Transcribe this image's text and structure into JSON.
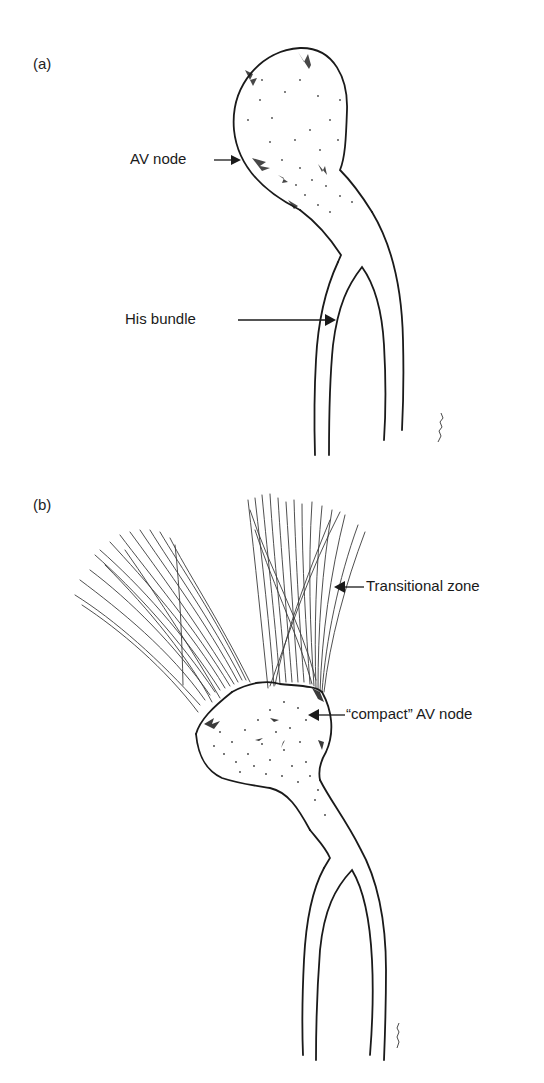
{
  "figure": {
    "panels": [
      {
        "id": "a",
        "label": "(a)",
        "annotations": [
          {
            "text": "AV node",
            "arrow": "right"
          },
          {
            "text": "His bundle",
            "arrow": "right"
          }
        ]
      },
      {
        "id": "b",
        "label": "(b)",
        "annotations": [
          {
            "text": "Transitional zone",
            "arrow": "left"
          },
          {
            "text": "“compact” AV node",
            "arrow": "left"
          }
        ]
      }
    ]
  },
  "colors": {
    "ink": "#1a1a1a",
    "background": "#ffffff"
  }
}
